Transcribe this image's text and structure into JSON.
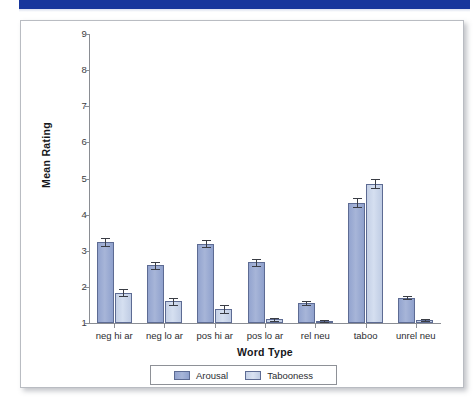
{
  "banner": {
    "color": "#17369c"
  },
  "chart_data": {
    "type": "bar",
    "title": "",
    "xlabel": "Word Type",
    "ylabel": "Mean Rating",
    "ylim": [
      1,
      9
    ],
    "yticks": [
      9,
      8,
      7,
      6,
      5,
      4,
      3,
      2,
      1
    ],
    "grid": false,
    "legend_position": "bottom",
    "categories": [
      "neg hi ar",
      "neg lo ar",
      "pos hi ar",
      "pos lo ar",
      "rel neu",
      "taboo",
      "unrel neu"
    ],
    "series": [
      {
        "name": "Arousal",
        "color": "#9aabd3",
        "values": [
          3.24,
          2.6,
          3.2,
          2.68,
          1.55,
          4.33,
          1.7
        ],
        "errors": [
          0.11,
          0.1,
          0.11,
          0.09,
          0.05,
          0.12,
          0.04
        ]
      },
      {
        "name": "Tabooness",
        "color": "#cbd6ea",
        "values": [
          1.84,
          1.6,
          1.38,
          1.1,
          1.05,
          4.86,
          1.08
        ],
        "errors": [
          0.1,
          0.1,
          0.11,
          0.04,
          0.03,
          0.13,
          0.03
        ]
      }
    ]
  }
}
